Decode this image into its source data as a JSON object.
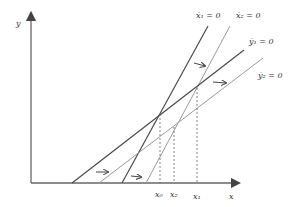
{
  "axes": {
    "x_label": "x",
    "y_label": "y"
  },
  "curves": [
    {
      "id": "x1dot",
      "label": "ẋ₁ = 0",
      "style": "dark"
    },
    {
      "id": "x2dot",
      "label": "ẋ₂ = 0",
      "style": "light"
    },
    {
      "id": "y1dot",
      "label": "ẏ₁ = 0",
      "style": "dark"
    },
    {
      "id": "y2dot",
      "label": "ẏ₂ = 0",
      "style": "light"
    }
  ],
  "x_ticks": [
    {
      "label": "x₀"
    },
    {
      "label": "x₂"
    },
    {
      "label": "x₁"
    }
  ],
  "colors": {
    "dark_line": "#4a4a4a",
    "light_line": "#9a9a9a",
    "axis": "#555555"
  }
}
